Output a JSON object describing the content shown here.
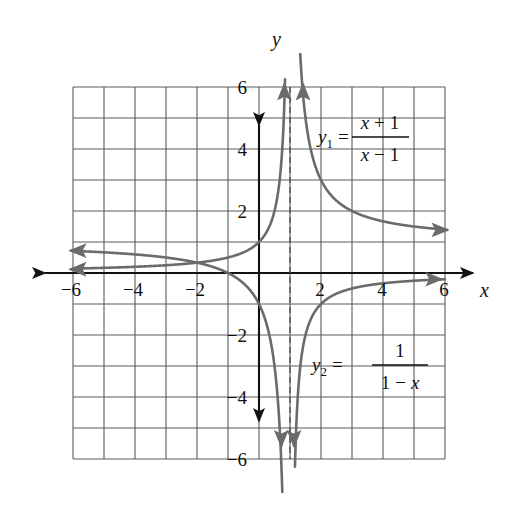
{
  "figure": {
    "kind": "coordinate-plane-graph",
    "background": "#ffffff",
    "grid_color": "#5a5a5a",
    "axis_color": "#111111",
    "curve_color": "#6b6b6b",
    "asymptote_color": "#555555"
  },
  "axes": {
    "x_label": "x",
    "y_label": "y",
    "x_ticks": [
      "-6",
      "-4",
      "-2",
      "2",
      "4",
      "6"
    ],
    "y_ticks": [
      "6",
      "4",
      "2",
      "-2",
      "-4",
      "-6"
    ]
  },
  "equations": {
    "y1": {
      "lhs": "y",
      "sub": "1",
      "eq": "=",
      "numerator_var": "x",
      "numerator_op": "+",
      "numerator_const": "1",
      "denominator_var": "x",
      "denominator_op": "−",
      "denominator_const": "1",
      "plain": "y1 = (x + 1)/(x - 1)"
    },
    "y2": {
      "lhs": "y",
      "sub": "2",
      "eq": "=",
      "numerator_const": "1",
      "denominator_const": "1",
      "denominator_op": "−",
      "denominator_var": "x",
      "plain": "y2 = 1/(1 - x)"
    }
  },
  "chart_data": {
    "type": "line",
    "title": "",
    "xlabel": "x",
    "ylabel": "y",
    "xlim": [
      -6,
      6
    ],
    "ylim": [
      -6,
      6
    ],
    "grid": true,
    "grid_step": 1,
    "tick_step": 2,
    "legend": "inline-annotations",
    "asymptotes": [
      {
        "type": "vertical",
        "x": 1,
        "style": "dashed",
        "shared_by": [
          "y1",
          "y2"
        ]
      },
      {
        "type": "horizontal",
        "y": 1,
        "style": "implied",
        "belongs_to": "y1"
      },
      {
        "type": "horizontal",
        "y": 0,
        "style": "implied",
        "belongs_to": "y2"
      }
    ],
    "series": [
      {
        "name": "y1 = (x + 1)/(x - 1)",
        "color": "#6b6b6b",
        "branches": [
          {
            "domain": [
              -6,
              0.82
            ],
            "note": "left branch: comes in from left near y=1, falls through (-1,0) and (0,-1), plunges to -6 at x->1-",
            "points": [
              {
                "x": -6.0,
                "y": 0.714
              },
              {
                "x": -5.0,
                "y": 0.667
              },
              {
                "x": -4.0,
                "y": 0.6
              },
              {
                "x": -3.0,
                "y": 0.5
              },
              {
                "x": -2.0,
                "y": 0.333
              },
              {
                "x": -1.0,
                "y": 0.0
              },
              {
                "x": -0.5,
                "y": -0.333
              },
              {
                "x": 0.0,
                "y": -1.0
              },
              {
                "x": 0.25,
                "y": -1.667
              },
              {
                "x": 0.5,
                "y": -3.0
              },
              {
                "x": 0.65,
                "y": -4.714
              },
              {
                "x": 0.75,
                "y": -7.0
              }
            ]
          },
          {
            "domain": [
              1.18,
              6
            ],
            "note": "right branch: rises to +6 at x->1+, decays toward y=1 as x->6",
            "points": [
              {
                "x": 1.4,
                "y": 6.0
              },
              {
                "x": 1.5,
                "y": 5.0
              },
              {
                "x": 1.75,
                "y": 3.667
              },
              {
                "x": 2.0,
                "y": 3.0
              },
              {
                "x": 2.5,
                "y": 2.333
              },
              {
                "x": 3.0,
                "y": 2.0
              },
              {
                "x": 4.0,
                "y": 1.667
              },
              {
                "x": 5.0,
                "y": 1.5
              },
              {
                "x": 6.0,
                "y": 1.4
              }
            ]
          }
        ]
      },
      {
        "name": "y2 = 1/(1 - x)",
        "color": "#6b6b6b",
        "branches": [
          {
            "domain": [
              -6,
              0.84
            ],
            "note": "left branch: enters from left just above y=0, passes (0,1), rises to +6 at x->1-",
            "points": [
              {
                "x": -6.0,
                "y": 0.143
              },
              {
                "x": -5.0,
                "y": 0.167
              },
              {
                "x": -4.0,
                "y": 0.2
              },
              {
                "x": -3.0,
                "y": 0.25
              },
              {
                "x": -2.0,
                "y": 0.333
              },
              {
                "x": -1.0,
                "y": 0.5
              },
              {
                "x": 0.0,
                "y": 1.0
              },
              {
                "x": 0.5,
                "y": 2.0
              },
              {
                "x": 0.7,
                "y": 3.333
              },
              {
                "x": 0.83,
                "y": 5.882
              },
              {
                "x": 0.86,
                "y": 7.0
              }
            ]
          },
          {
            "domain": [
              1.16,
              6
            ],
            "note": "right branch: comes up from -6 at x->1+, passes (2,-1), approaches y=0 from below",
            "points": [
              {
                "x": 1.14,
                "y": -7.0
              },
              {
                "x": 1.2,
                "y": -5.0
              },
              {
                "x": 1.5,
                "y": -2.0
              },
              {
                "x": 2.0,
                "y": -1.0
              },
              {
                "x": 3.0,
                "y": -0.5
              },
              {
                "x": 4.0,
                "y": -0.333
              },
              {
                "x": 5.0,
                "y": -0.25
              },
              {
                "x": 6.0,
                "y": -0.2
              }
            ]
          }
        ]
      }
    ],
    "arrowheads": [
      {
        "at": [
          -6.1,
          0.72
        ],
        "dir": "left",
        "series": "y1"
      },
      {
        "at": [
          -6.1,
          0.12
        ],
        "dir": "left",
        "series": "y2"
      },
      {
        "at": [
          6.1,
          1.39
        ],
        "dir": "right",
        "series": "y1"
      },
      {
        "at": [
          5.9,
          -0.2
        ],
        "dir": "right",
        "series": "y2"
      },
      {
        "at": [
          0.82,
          6.1
        ],
        "dir": "up",
        "series": "y2"
      },
      {
        "at": [
          1.42,
          6.1
        ],
        "dir": "up",
        "series": "y1"
      },
      {
        "at": [
          0.72,
          -5.6
        ],
        "dir": "down",
        "series": "y1"
      },
      {
        "at": [
          1.13,
          -5.6
        ],
        "dir": "down",
        "series": "y2"
      }
    ]
  }
}
